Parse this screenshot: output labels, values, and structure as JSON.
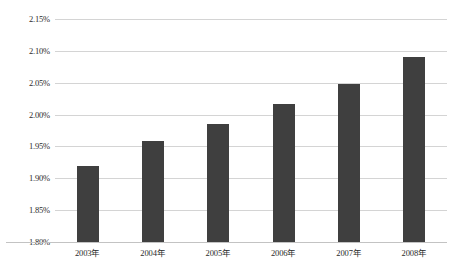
{
  "chart_data": {
    "type": "bar",
    "title": "",
    "subtitle": "",
    "xlabel": "",
    "ylabel": "",
    "categories": [
      "2003年",
      "2004年",
      "2005年",
      "2006年",
      "2007年",
      "2008年"
    ],
    "values": [
      1.92,
      1.958,
      1.985,
      2.017,
      2.048,
      2.09
    ],
    "value_labels": [
      "1.92%",
      "1.958%",
      "1.985%",
      "2.017%",
      "2.048%",
      "2.09%"
    ],
    "unit": "%",
    "ylim": [
      1.8,
      2.15
    ],
    "ytick_values": [
      2.15,
      2.1,
      2.05,
      2.0,
      1.95,
      1.9,
      1.85,
      1.8
    ],
    "ytick_labels": [
      "2.15%",
      "2.10%",
      "2.05%",
      "2.00%",
      "1.95%",
      "1.90%",
      "1.85%",
      "1.80%"
    ],
    "grid": true,
    "grid_axis": "y",
    "legend": false,
    "legend_position": "none",
    "series": [
      {
        "name": "",
        "values": [
          1.92,
          1.958,
          1.985,
          2.017,
          2.048,
          2.09
        ],
        "color": "#3F3F3F"
      }
    ],
    "colors": {
      "bar": "#3F3F3F",
      "gridline": "#D4D4D4",
      "axis": "#B9B9B9",
      "text": "#2B2B2B",
      "background": "#FFFFFF"
    },
    "annotations": [],
    "data_labels": false
  }
}
